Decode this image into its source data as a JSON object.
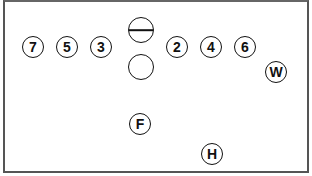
{
  "diagram": {
    "type": "formation",
    "border_color": "#555555",
    "positions": [
      {
        "label": "7",
        "x": 33,
        "y": 47
      },
      {
        "label": "5",
        "x": 67,
        "y": 47
      },
      {
        "label": "3",
        "x": 101,
        "y": 47
      },
      {
        "label": "",
        "symbol": "circle-with-line",
        "x": 141,
        "y": 30
      },
      {
        "label": "",
        "symbol": "empty-circle",
        "x": 141,
        "y": 67
      },
      {
        "label": "2",
        "x": 177,
        "y": 47
      },
      {
        "label": "4",
        "x": 211,
        "y": 47
      },
      {
        "label": "6",
        "x": 245,
        "y": 47
      },
      {
        "label": "W",
        "x": 276,
        "y": 72
      },
      {
        "label": "F",
        "x": 140,
        "y": 124
      },
      {
        "label": "H",
        "x": 212,
        "y": 154
      }
    ]
  }
}
